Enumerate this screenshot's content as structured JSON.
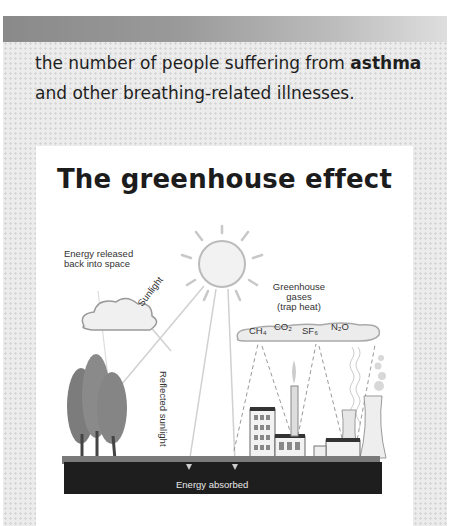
{
  "paragraph": {
    "before": "the number of people suffering from ",
    "bold": "asthma",
    "after": " and other breathing-related illnesses."
  },
  "figure": {
    "title": "The greenhouse effect",
    "labels": {
      "energy_released_line1": "Energy released",
      "energy_released_line2": "back into space",
      "sunlight": "Sunlight",
      "greenhouse_line1": "Greenhouse gases",
      "greenhouse_line2": "(trap heat)",
      "ch4": "CH₄",
      "co2": "CO₂",
      "sf6": "SF₆",
      "n2o": "N₂O",
      "reflected": "Reflected sunlight",
      "absorbed": "Energy absorbed"
    }
  },
  "colors": {
    "band_dark": "#8a8a8a",
    "panel": "#ececec",
    "ground": "#1e1e1e"
  }
}
